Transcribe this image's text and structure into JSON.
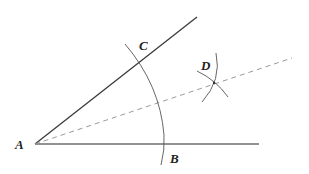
{
  "diagram": {
    "type": "angle bisector construction",
    "points": {
      "A": {
        "label": "A",
        "x": 35,
        "y": 144,
        "label_x": 15,
        "label_y": 149
      },
      "B": {
        "label": "B",
        "x": 164,
        "y": 144,
        "label_x": 170,
        "label_y": 163
      },
      "C": {
        "label": "C",
        "x": 141,
        "y": 61,
        "label_x": 139,
        "label_y": 50
      },
      "D": {
        "label": "D",
        "x": 214,
        "y": 83,
        "label_x": 201,
        "label_y": 70
      }
    },
    "colors": {
      "ray": "#3a3a3a",
      "base_ray": "#6e6e6e",
      "arc": "#555555",
      "dashed": "#9a9a9a",
      "label": "#222222"
    }
  }
}
